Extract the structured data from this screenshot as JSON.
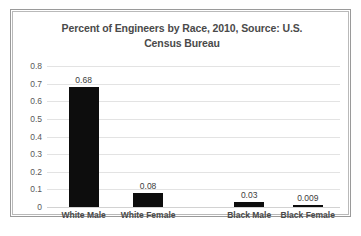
{
  "chart_data": {
    "type": "bar",
    "title": "Percent of Engineers by Race, 2010, Source: U.S. Census Bureau",
    "title_line1": "Percent of Engineers by Race, 2010, Source: U.S.",
    "title_line2": "Census Bureau",
    "xlabel": "",
    "ylabel": "",
    "categories": [
      "White Male",
      "White Female",
      "Black Male",
      "Black Female"
    ],
    "values": [
      0.68,
      0.08,
      0.03,
      0.009
    ],
    "value_labels": [
      "0.68",
      "0.08",
      "0.03",
      "0.009"
    ],
    "ylim": [
      0,
      0.8
    ],
    "ytick_labels": [
      "0.8",
      "0.7",
      "0.6",
      "0.5",
      "0.4",
      "0.3",
      "0.2",
      "0.1",
      "0"
    ],
    "ytick_values": [
      0.8,
      0.7,
      0.6,
      0.5,
      0.4,
      0.3,
      0.2,
      0.1,
      0
    ],
    "grid": true,
    "legend": false,
    "bar_color": "#0d0d0d",
    "gridline_color": "#e3e3e3",
    "title_color": "#4a4a4a",
    "axis_text_color": "#595959",
    "plot_background": "#ffffff"
  }
}
